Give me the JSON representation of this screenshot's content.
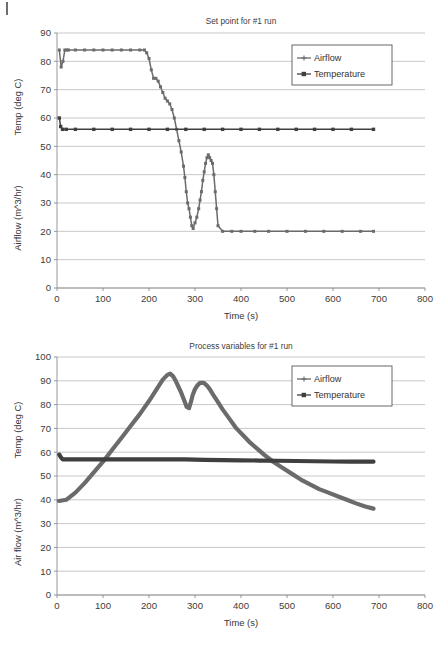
{
  "page": {
    "background_color": "#ffffff",
    "artifact_mark": "|"
  },
  "colors": {
    "airflow": "#6b6b6b",
    "temperature": "#3f3f3f",
    "grid": "#b9b9b9",
    "axis": "#8d8d8d",
    "text": "#3a3a3a",
    "legend_border": "#575757"
  },
  "figures": [
    {
      "id": "set-point",
      "title": "Set point for #1 run",
      "legend": {
        "position": "top-right",
        "entries": [
          {
            "label": "Airflow",
            "marker": "cross-line",
            "color": "#6b6b6b"
          },
          {
            "label": "Temperature",
            "marker": "square-line",
            "color": "#3f3f3f"
          }
        ]
      },
      "xaxis": {
        "label": "Time (s)",
        "min": 0,
        "max": 800,
        "ticks": [
          0,
          100,
          200,
          300,
          400,
          500,
          600,
          700,
          800
        ]
      },
      "yaxis": {
        "labels": [
          "Temp (deg C)",
          "Airflow (m^3/hr)"
        ],
        "min": 0,
        "max": 90,
        "ticks": [
          0,
          10,
          20,
          30,
          40,
          50,
          60,
          70,
          80,
          90
        ]
      }
    },
    {
      "id": "process-variables",
      "title": "Process variables for #1 run",
      "legend": {
        "position": "top-right",
        "entries": [
          {
            "label": "Airflow",
            "marker": "cross-line",
            "color": "#6b6b6b"
          },
          {
            "label": "Temperature",
            "marker": "square-line",
            "color": "#3f3f3f"
          }
        ]
      },
      "xaxis": {
        "label": "Time (s)",
        "min": 0,
        "max": 800,
        "ticks": [
          0,
          100,
          200,
          300,
          400,
          500,
          600,
          700,
          800
        ]
      },
      "yaxis": {
        "labels": [
          "Temp (deg C)",
          "Air flow (m^3/hr)"
        ],
        "min": 0,
        "max": 100,
        "ticks": [
          0,
          10,
          20,
          30,
          40,
          50,
          60,
          70,
          80,
          90,
          100
        ]
      }
    }
  ],
  "chart_data": [
    {
      "type": "line",
      "title": "Set point for #1 run",
      "xlabel": "Time (s)",
      "ylabel": "Temp (deg C) / Airflow (m^3/hr)",
      "xlim": [
        0,
        800
      ],
      "ylim": [
        0,
        90
      ],
      "grid": true,
      "legend": "top-right",
      "series": [
        {
          "name": "Airflow",
          "marker": "cross",
          "color": "#6b6b6b",
          "x": [
            5,
            9,
            13,
            17,
            21,
            25,
            40,
            60,
            80,
            100,
            120,
            140,
            160,
            180,
            190,
            195,
            200,
            205,
            210,
            215,
            220,
            225,
            230,
            235,
            240,
            245,
            250,
            255,
            260,
            265,
            270,
            275,
            278,
            281,
            284,
            287,
            290,
            293,
            296,
            300,
            304,
            308,
            311,
            314,
            317,
            320,
            323,
            326,
            329,
            332,
            335,
            338,
            341,
            344,
            347,
            350,
            360,
            380,
            400,
            430,
            460,
            500,
            540,
            580,
            620,
            660,
            688
          ],
          "y": [
            84,
            78,
            80,
            84,
            84,
            84,
            84,
            84,
            84,
            84,
            84,
            84,
            84,
            84,
            84,
            83,
            81,
            77,
            74,
            74,
            73,
            71,
            69,
            67,
            66,
            65,
            63,
            60,
            56,
            52,
            48,
            43,
            39,
            34,
            30,
            28,
            25,
            22,
            21,
            23,
            25,
            28,
            31,
            34,
            38,
            41,
            44,
            46,
            47,
            46,
            45,
            44,
            40,
            34,
            28,
            22,
            20,
            20,
            20,
            20,
            20,
            20,
            20,
            20,
            20,
            20,
            20
          ]
        },
        {
          "name": "Temperature",
          "marker": "square",
          "color": "#3f3f3f",
          "x": [
            5,
            8,
            12,
            20,
            40,
            80,
            120,
            160,
            200,
            240,
            280,
            320,
            360,
            400,
            440,
            480,
            520,
            560,
            600,
            640,
            688
          ],
          "y": [
            60,
            57,
            56,
            56,
            56,
            56,
            56,
            56,
            56,
            56,
            56,
            56,
            56,
            56,
            56,
            56,
            56,
            56,
            56,
            56,
            56
          ]
        }
      ]
    },
    {
      "type": "line",
      "title": "Process variables for #1 run",
      "xlabel": "Time (s)",
      "ylabel": "Temp (deg C) / Air flow (m^3/hr)",
      "xlim": [
        0,
        800
      ],
      "ylim": [
        0,
        100
      ],
      "grid": true,
      "legend": "top-right",
      "series": [
        {
          "name": "Airflow",
          "marker": "cross",
          "color": "#6b6b6b",
          "x": [
            4,
            20,
            40,
            60,
            80,
            100,
            120,
            140,
            160,
            180,
            200,
            215,
            230,
            240,
            246,
            252,
            258,
            264,
            270,
            276,
            282,
            287,
            291,
            295,
            300,
            305,
            310,
            315,
            320,
            326,
            332,
            340,
            350,
            360,
            375,
            390,
            405,
            420,
            435,
            450,
            470,
            490,
            510,
            530,
            550,
            570,
            590,
            610,
            630,
            650,
            670,
            688
          ],
          "y": [
            39.5,
            40,
            43,
            47,
            51.5,
            56,
            61,
            66,
            71,
            76,
            81.5,
            86,
            90.5,
            92.5,
            93,
            92,
            90,
            87.5,
            85,
            82,
            79,
            78.5,
            81,
            84,
            86.5,
            88,
            89,
            89.2,
            89,
            88,
            86.5,
            84,
            81,
            78,
            74,
            70,
            67,
            64,
            61.5,
            59,
            56,
            53.5,
            51,
            48.5,
            46.5,
            44.5,
            43,
            41.5,
            40,
            38.5,
            37.2,
            36.3
          ]
        },
        {
          "name": "Temperature",
          "marker": "square",
          "color": "#3f3f3f",
          "x": [
            5,
            8,
            12,
            20,
            40,
            80,
            120,
            160,
            200,
            240,
            280,
            320,
            360,
            400,
            440,
            480,
            520,
            560,
            600,
            640,
            688
          ],
          "y": [
            59,
            58,
            57,
            57,
            57,
            57,
            57,
            57,
            57,
            57,
            57,
            56.8,
            56.7,
            56.6,
            56.5,
            56.4,
            56.3,
            56.2,
            56.1,
            56,
            56
          ]
        }
      ]
    }
  ]
}
